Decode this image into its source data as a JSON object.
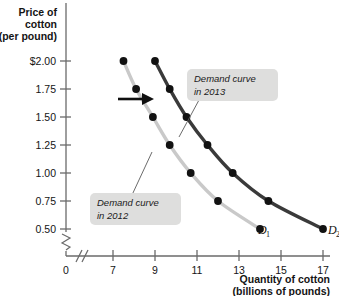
{
  "chart_data": {
    "type": "line",
    "title": "",
    "ylabel": "Price of cotton (per pound)",
    "ylabel_lines": [
      "Price of",
      "cotton",
      "(per pound)"
    ],
    "xlabel": "Quantity of cotton (billions of pounds)",
    "xlabel_lines": [
      "Quantity of cotton",
      "(billions of pounds)"
    ],
    "xlim": [
      6.3,
      17.9
    ],
    "ylim": [
      0.38,
      2.12
    ],
    "grid": false,
    "legend_position": "inline-annotations",
    "axis_break_x": true,
    "axis_break_y": true,
    "x_ticks": [
      "7",
      "9",
      "11",
      "13",
      "15",
      "17"
    ],
    "x_tick_values": [
      7,
      9,
      11,
      13,
      15,
      17
    ],
    "y_ticks": [
      "$2.00",
      "1.75",
      "1.50",
      "1.25",
      "1.00",
      "0.75",
      "0.50"
    ],
    "y_tick_values": [
      2.0,
      1.75,
      1.5,
      1.25,
      1.0,
      0.75,
      0.5
    ],
    "origin_label": "0",
    "series": [
      {
        "name": "D1",
        "label": "D",
        "subscript": "1",
        "annotation": "Demand curve in 2012",
        "annotation_lines": [
          "Demand curve",
          "in 2012"
        ],
        "color": "#c9c9c9",
        "x": [
          7.5,
          8.1,
          8.9,
          9.7,
          10.7,
          12.0,
          14.0
        ],
        "y": [
          2.0,
          1.75,
          1.5,
          1.25,
          1.0,
          0.75,
          0.5
        ]
      },
      {
        "name": "D2",
        "label": "D",
        "subscript": "2",
        "annotation": "Demand curve in 2013",
        "annotation_lines": [
          "Demand curve",
          "in 2013"
        ],
        "color": "#3a3a3a",
        "x": [
          9.0,
          9.7,
          10.5,
          11.5,
          12.7,
          14.4,
          17.0
        ],
        "y": [
          2.0,
          1.75,
          1.5,
          1.25,
          1.0,
          0.75,
          0.5
        ]
      }
    ],
    "annotations": [
      {
        "name": "shift-arrow",
        "text": "",
        "description": "rightward shift arrow between curves"
      }
    ],
    "colors": {
      "curve_2012": "#c9c9c9",
      "curve_2013": "#3a3a3a",
      "point": "#121212",
      "axis": "#5a5a5a",
      "callout_bg": "#dededd",
      "text": "#141414"
    }
  }
}
